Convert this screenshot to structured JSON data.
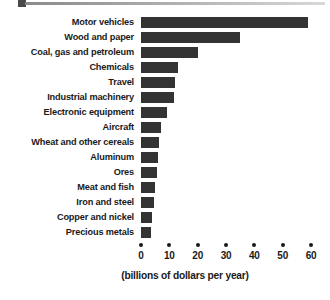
{
  "header": {
    "rule_square_name": "top-rule-marker",
    "accent_color": "#4a4a4a",
    "rule_color": "#8a8a8a"
  },
  "chart_data": {
    "type": "bar",
    "orientation": "horizontal",
    "title": "",
    "subtitle": "",
    "xlabel": "(billions of dollars per year)",
    "ylabel": "",
    "xlim": [
      0,
      65
    ],
    "xticks": [
      0,
      10,
      20,
      30,
      40,
      50,
      60
    ],
    "xticklabels": [
      "0",
      "10",
      "20",
      "30",
      "40",
      "50",
      "60"
    ],
    "grid": false,
    "legend": null,
    "bar_color": "#333333",
    "categories": [
      "Motor vehicles",
      "Wood and paper",
      "Coal, gas and petroleum",
      "Chemicals",
      "Travel",
      "Industrial machinery",
      "Electronic equipment",
      "Aircraft",
      "Wheat and other cereals",
      "Aluminum",
      "Ores",
      "Meat and fish",
      "Iron and steel",
      "Copper and nickel",
      "Precious metals"
    ],
    "values": [
      59,
      35,
      20,
      13,
      12,
      11.5,
      9,
      7,
      6.5,
      6,
      5.5,
      5,
      4.5,
      4,
      3.5
    ],
    "units": "billions of dollars per year"
  }
}
